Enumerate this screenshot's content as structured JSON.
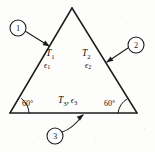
{
  "figure": {
    "background_color": "#fdfdfc",
    "line_color": "#1d1d1d"
  },
  "triangle": {
    "name": "equilateral-triangle",
    "apex": {
      "x": 72,
      "y": 8
    },
    "bottom_left": {
      "x": 10,
      "y": 113
    },
    "bottom_right": {
      "x": 137,
      "y": 113
    }
  },
  "surfaces": [
    {
      "id": "surface-1",
      "temperature_label": "T",
      "temperature_sub": "1",
      "emissivity_label": "ϵ",
      "emissivity_sub": "1",
      "temp_pos": {
        "x": 46,
        "y": 53
      },
      "eps_pos": {
        "x": 44,
        "y": 65
      }
    },
    {
      "id": "surface-2",
      "temperature_label": "T",
      "temperature_sub": "2",
      "emissivity_label": "ϵ",
      "emissivity_sub": "2",
      "temp_pos": {
        "x": 82,
        "y": 53
      },
      "eps_pos": {
        "x": 85,
        "y": 65
      }
    }
  ],
  "base_surface": {
    "id": "surface-3",
    "temperature_label": "T",
    "temperature_sub": "3",
    "separator": ",",
    "emissivity_label": "ϵ",
    "emissivity_sub": "3",
    "pos": {
      "x": 58,
      "y": 100
    }
  },
  "angles": [
    {
      "id": "angle-bottom-left",
      "label": "60°",
      "pos": {
        "x": 22,
        "y": 103
      },
      "vertex": {
        "x": 10,
        "y": 113
      }
    },
    {
      "id": "angle-bottom-right",
      "label": "60°",
      "pos": {
        "x": 104,
        "y": 103
      },
      "vertex": {
        "x": 137,
        "y": 113
      }
    }
  ],
  "callouts": [
    {
      "id": "callout-1",
      "label": "1",
      "center": {
        "x": 18,
        "y": 28
      },
      "radius": 8,
      "leader_start": {
        "x": 25,
        "y": 31
      },
      "leader_end": {
        "x": 49,
        "y": 46
      }
    },
    {
      "id": "callout-2",
      "label": "2",
      "center": {
        "x": 136,
        "y": 45
      },
      "radius": 8,
      "leader_start": {
        "x": 128,
        "y": 48
      },
      "leader_end": {
        "x": 107,
        "y": 62
      }
    },
    {
      "id": "callout-3",
      "label": "3",
      "center": {
        "x": 55,
        "y": 136
      },
      "radius": 8,
      "leader_start": {
        "x": 62,
        "y": 132
      },
      "leader_end": {
        "x": 83,
        "y": 115
      }
    }
  ]
}
